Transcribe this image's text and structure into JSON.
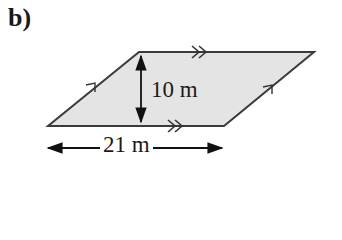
{
  "part_label": "b)",
  "shape": {
    "type": "parallelogram",
    "fill_color": "#e4e4e4",
    "stroke_color": "#333333",
    "vertices": [
      [
        139,
        52
      ],
      [
        314,
        52
      ],
      [
        224,
        126
      ],
      [
        48,
        126
      ]
    ],
    "parallel_marks": {
      "top_bottom": "double-arrow",
      "left_right": "single-arrow"
    }
  },
  "dimensions": {
    "height": {
      "value": 10,
      "unit": "m",
      "text": "10 m"
    },
    "base": {
      "value": 21,
      "unit": "m",
      "text": "21 m"
    }
  }
}
